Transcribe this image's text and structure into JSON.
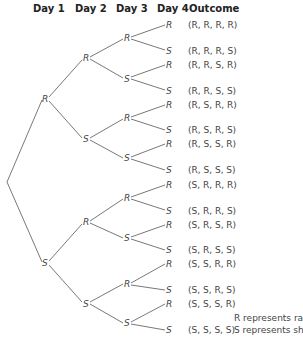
{
  "headers": {
    "day1": "Day 1",
    "day2": "Day 2",
    "day3": "Day 3",
    "day4": "Day 4",
    "outcome": "Outcome"
  },
  "nodes": {
    "d1": [
      "R",
      "S"
    ],
    "d2": [
      "R",
      "S",
      "R",
      "S"
    ],
    "d3": [
      "R",
      "S",
      "R",
      "S",
      "R",
      "S",
      "R",
      "S"
    ],
    "d4": [
      "R",
      "S",
      "R",
      "S",
      "R",
      "S",
      "R",
      "S",
      "R",
      "S",
      "R",
      "S",
      "R",
      "S",
      "R",
      "S"
    ]
  },
  "outcomes": [
    "(R, R, R, R)",
    "(R, R, R, S)",
    "(R, R, S, R)",
    "(R, R, S, S)",
    "(R, S, R, R)",
    "(R, S, R, S)",
    "(R, S, S, R)",
    "(R, S, S, S)",
    "(S, R, R, R)",
    "(S, R, R, S)",
    "(S, R, S, R)",
    "(S, R, S, S)",
    "(S, S, R, R)",
    "(S, S, R, S)",
    "(S, S, S, R)",
    "(S, S, S, S)"
  ],
  "legend": {
    "r": "R represents rain",
    "s": "S represents shine"
  }
}
